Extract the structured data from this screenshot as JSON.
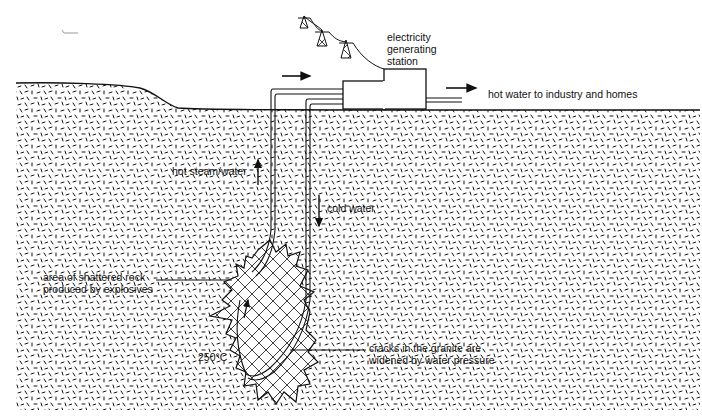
{
  "diagram": {
    "type": "geothermal hot dry rock system cross-section",
    "colors": {
      "ink": "#111111",
      "background": "#ffffff"
    },
    "labels": {
      "station": [
        "electricity",
        "generating",
        "station"
      ],
      "hot_water_out": "hot water to industry and homes",
      "hot_steam": "hot steam/water",
      "cold_water": "cold water",
      "shattered_rock": [
        "area of shattered rock",
        "produced by explosives"
      ],
      "temperature": "250°C",
      "cracks": [
        "cracks in the granite are",
        "widened by water pressure"
      ]
    },
    "icons": [
      "pylon-icon",
      "pylon-icon",
      "pylon-icon",
      "arrow-right-icon",
      "arrow-right-icon",
      "arrow-up-icon",
      "arrow-down-icon"
    ]
  }
}
